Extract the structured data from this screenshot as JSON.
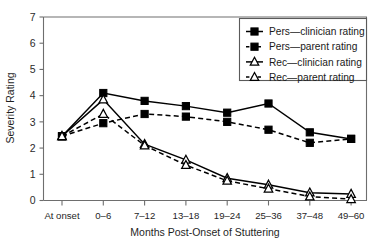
{
  "chart_data": {
    "type": "line",
    "title": "",
    "xlabel": "Months Post-Onset of Stuttering",
    "ylabel": "Severity Rating",
    "categories": [
      "At onset",
      "0–6",
      "7–12",
      "13–18",
      "19–24",
      "25–36",
      "37–48",
      "49–60"
    ],
    "ylim": [
      0,
      7
    ],
    "yticks": [
      0,
      1,
      2,
      3,
      4,
      5,
      6,
      7
    ],
    "ytick_labels": [
      "0",
      "1",
      "2",
      "3",
      "4",
      "5",
      "6",
      "7"
    ],
    "grid": false,
    "legend_position": "top-right",
    "series": [
      {
        "name": "Pers—clinician rating",
        "marker": "filled-square",
        "line_style": "solid",
        "color": "#000000",
        "values": [
          2.45,
          4.1,
          3.8,
          3.6,
          3.35,
          3.7,
          2.6,
          2.35
        ]
      },
      {
        "name": "Pers—parent rating",
        "marker": "filled-square",
        "line_style": "dashed",
        "color": "#000000",
        "values": [
          2.45,
          2.95,
          3.3,
          3.2,
          3.0,
          2.7,
          2.2,
          2.35
        ]
      },
      {
        "name": "Rec—clinician rating",
        "marker": "open-triangle",
        "line_style": "solid",
        "color": "#000000",
        "values": [
          2.45,
          3.85,
          2.15,
          1.55,
          0.85,
          0.6,
          0.3,
          0.25
        ]
      },
      {
        "name": "Rec—parent rating",
        "marker": "open-triangle",
        "line_style": "dashed",
        "color": "#000000",
        "values": [
          2.45,
          3.3,
          2.1,
          1.35,
          0.75,
          0.45,
          0.15,
          0.05
        ]
      }
    ]
  },
  "legend": {
    "entries": [
      "Pers—clinician rating",
      "Pers—parent rating",
      "Rec—clinician rating",
      "Rec—parent rating"
    ]
  }
}
